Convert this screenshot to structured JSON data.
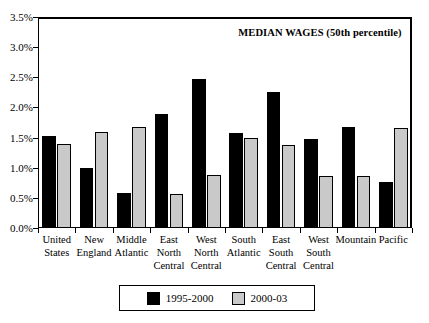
{
  "chart_data": {
    "type": "bar",
    "title": "MEDIAN WAGES (50th percentile)",
    "xlabel": "",
    "ylabel": "",
    "ylim": [
      0.0,
      3.5
    ],
    "ytick_labels": [
      "0.0%",
      "0.5%",
      "1.0%",
      "1.5%",
      "2.0%",
      "2.5%",
      "3.0%",
      "3.5%"
    ],
    "ytick_values": [
      0.0,
      0.5,
      1.0,
      1.5,
      2.0,
      2.5,
      3.0,
      3.5
    ],
    "grid": false,
    "legend_position": "bottom",
    "categories": [
      "United States",
      "New England",
      "Middle Atlantic",
      "East North Central",
      "West North Central",
      "South Atlantic",
      "East South Central",
      "West South Central",
      "Mountain",
      "Pacific"
    ],
    "series": [
      {
        "name": "1995-2000",
        "color": "#000000",
        "values": [
          1.52,
          1.0,
          0.58,
          1.89,
          2.47,
          1.57,
          2.25,
          1.48,
          1.67,
          0.77
        ]
      },
      {
        "name": "2000-03",
        "color": "#c9c9c9",
        "values": [
          1.4,
          1.59,
          1.68,
          0.57,
          0.88,
          1.49,
          1.37,
          0.87,
          0.87,
          1.66
        ]
      }
    ]
  },
  "legend": {
    "entries": [
      {
        "label": "1995-2000",
        "swatch": "black-swatch"
      },
      {
        "label": "2000-03",
        "swatch": "gray-swatch"
      }
    ]
  }
}
